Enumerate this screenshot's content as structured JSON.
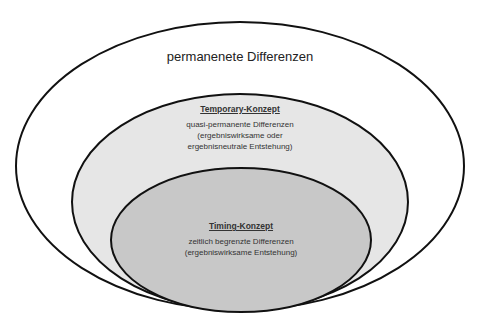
{
  "diagram": {
    "outer": {
      "label": "permanenete Differenzen",
      "fill": "#ffffff",
      "stroke": "#111111"
    },
    "middle": {
      "title": "Temporary-Konzept",
      "lines": [
        "quasi-permanente Differenzen",
        "(ergebniswirksame oder",
        "ergebnisneutrale Entstehung)"
      ],
      "fill": "#e6e6e6",
      "stroke": "#111111"
    },
    "inner": {
      "title": "Timing-Konzept",
      "lines": [
        "zeitlich begrenzte Differenzen",
        "(ergebniswirksame Entstehung)"
      ],
      "fill": "#c8c8c8",
      "stroke": "#111111"
    }
  }
}
